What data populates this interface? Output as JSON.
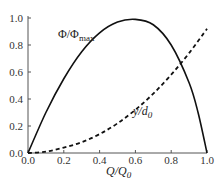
{
  "chart_data": {
    "type": "line",
    "title": "",
    "xlabel": "Q/Q0",
    "ylabel": "",
    "xlim": [
      0,
      1
    ],
    "ylim": [
      0,
      1
    ],
    "grid": false,
    "x_ticks": [
      "0.0",
      "0.2",
      "0.4",
      "0.6",
      "0.8",
      "1.0"
    ],
    "y_ticks": [
      "0.0",
      "0.2",
      "0.4",
      "0.6",
      "0.8",
      "1.0"
    ],
    "series": [
      {
        "name": "Φ/Φmax",
        "style": "solid",
        "x": [
          0.0,
          0.1,
          0.2,
          0.3,
          0.4,
          0.5,
          0.6,
          0.7,
          0.8,
          0.9,
          0.95,
          1.0
        ],
        "values": [
          0.0,
          0.3,
          0.55,
          0.75,
          0.89,
          0.97,
          0.99,
          0.95,
          0.8,
          0.52,
          0.3,
          0.0
        ]
      },
      {
        "name": "y/d0",
        "style": "dashed",
        "x": [
          0.0,
          0.1,
          0.2,
          0.3,
          0.4,
          0.5,
          0.6,
          0.7,
          0.8,
          0.9,
          1.0
        ],
        "values": [
          0.0,
          0.01,
          0.04,
          0.08,
          0.14,
          0.22,
          0.32,
          0.44,
          0.58,
          0.74,
          0.92
        ]
      }
    ],
    "annotations": [
      {
        "text": "Φ/Φmax",
        "x": 0.2,
        "y": 0.84
      },
      {
        "text": "y/d0",
        "x": 0.6,
        "y": 0.45
      }
    ]
  },
  "labels": {
    "phi_main": "Φ/Φ",
    "phi_sub": "max",
    "y_main": "y/d",
    "y_sub": "0",
    "x_main": "Q/Q",
    "x_sub": "0"
  }
}
